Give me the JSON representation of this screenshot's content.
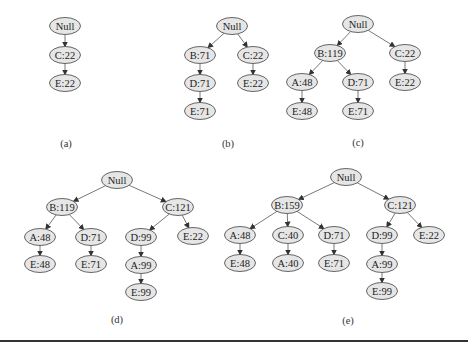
{
  "figure": {
    "node_fill": "#e6e6e6",
    "node_stroke": "#555555",
    "edge_color": "#555555",
    "trees": [
      {
        "id": "a",
        "caption": "(a)",
        "caption_pos": [
          66,
          143
        ],
        "nodes": [
          {
            "id": "null",
            "label": "Null",
            "x": 65,
            "y": 26
          },
          {
            "id": "c",
            "label": "C:22",
            "x": 65,
            "y": 55
          },
          {
            "id": "ce",
            "label": "E:22",
            "x": 65,
            "y": 83
          }
        ],
        "edges": [
          [
            "null",
            "c"
          ],
          [
            "c",
            "ce"
          ]
        ]
      },
      {
        "id": "b",
        "caption": "(b)",
        "caption_pos": [
          228,
          143
        ],
        "nodes": [
          {
            "id": "null",
            "label": "Null",
            "x": 232,
            "y": 26
          },
          {
            "id": "b",
            "label": "B:71",
            "x": 200,
            "y": 55
          },
          {
            "id": "c",
            "label": "C:22",
            "x": 253,
            "y": 55
          },
          {
            "id": "bd",
            "label": "D:71",
            "x": 200,
            "y": 83
          },
          {
            "id": "ce",
            "label": "E:22",
            "x": 253,
            "y": 83
          },
          {
            "id": "bde",
            "label": "E:71",
            "x": 200,
            "y": 111
          }
        ],
        "edges": [
          [
            "null",
            "b"
          ],
          [
            "null",
            "c"
          ],
          [
            "b",
            "bd"
          ],
          [
            "c",
            "ce"
          ],
          [
            "bd",
            "bde"
          ]
        ]
      },
      {
        "id": "c",
        "caption": "(c)",
        "caption_pos": [
          358,
          142
        ],
        "nodes": [
          {
            "id": "null",
            "label": "Null",
            "x": 358,
            "y": 24
          },
          {
            "id": "b",
            "label": "B:119",
            "x": 330,
            "y": 53
          },
          {
            "id": "c",
            "label": "C:22",
            "x": 405,
            "y": 53
          },
          {
            "id": "ba",
            "label": "A:48",
            "x": 302,
            "y": 82
          },
          {
            "id": "bd",
            "label": "D:71",
            "x": 358,
            "y": 82
          },
          {
            "id": "ce",
            "label": "E:22",
            "x": 405,
            "y": 82
          },
          {
            "id": "bae",
            "label": "E:48",
            "x": 302,
            "y": 111
          },
          {
            "id": "bde",
            "label": "E:71",
            "x": 358,
            "y": 111
          }
        ],
        "edges": [
          [
            "null",
            "b"
          ],
          [
            "null",
            "c"
          ],
          [
            "b",
            "ba"
          ],
          [
            "b",
            "bd"
          ],
          [
            "c",
            "ce"
          ],
          [
            "ba",
            "bae"
          ],
          [
            "bd",
            "bde"
          ]
        ]
      },
      {
        "id": "d",
        "caption": "(d)",
        "caption_pos": [
          117,
          319
        ],
        "nodes": [
          {
            "id": "null",
            "label": "Null",
            "x": 117,
            "y": 180
          },
          {
            "id": "b",
            "label": "B:119",
            "x": 62,
            "y": 207
          },
          {
            "id": "c",
            "label": "C:121",
            "x": 178,
            "y": 207
          },
          {
            "id": "ba",
            "label": "A:48",
            "x": 40,
            "y": 237
          },
          {
            "id": "bd",
            "label": "D:71",
            "x": 91,
            "y": 237
          },
          {
            "id": "cd",
            "label": "D:99",
            "x": 141,
            "y": 237
          },
          {
            "id": "ce",
            "label": "E:22",
            "x": 193,
            "y": 236
          },
          {
            "id": "bae",
            "label": "E:48",
            "x": 40,
            "y": 264
          },
          {
            "id": "bde",
            "label": "E:71",
            "x": 91,
            "y": 264
          },
          {
            "id": "cda",
            "label": "A:99",
            "x": 141,
            "y": 265
          },
          {
            "id": "cdae",
            "label": "E:99",
            "x": 141,
            "y": 292
          }
        ],
        "edges": [
          [
            "null",
            "b"
          ],
          [
            "null",
            "c"
          ],
          [
            "b",
            "ba"
          ],
          [
            "b",
            "bd"
          ],
          [
            "c",
            "cd"
          ],
          [
            "c",
            "ce"
          ],
          [
            "ba",
            "bae"
          ],
          [
            "bd",
            "bde"
          ],
          [
            "cd",
            "cda"
          ],
          [
            "cda",
            "cdae"
          ]
        ]
      },
      {
        "id": "e",
        "caption": "(e)",
        "caption_pos": [
          348,
          320
        ],
        "nodes": [
          {
            "id": "null",
            "label": "Null",
            "x": 346,
            "y": 177
          },
          {
            "id": "b",
            "label": "B:159",
            "x": 287,
            "y": 205
          },
          {
            "id": "c",
            "label": "C:121",
            "x": 400,
            "y": 205
          },
          {
            "id": "ba",
            "label": "A:48",
            "x": 240,
            "y": 235
          },
          {
            "id": "bc",
            "label": "C:40",
            "x": 288,
            "y": 235
          },
          {
            "id": "bd",
            "label": "D:71",
            "x": 334,
            "y": 235
          },
          {
            "id": "cd",
            "label": "D:99",
            "x": 382,
            "y": 235
          },
          {
            "id": "ce",
            "label": "E:22",
            "x": 429,
            "y": 235
          },
          {
            "id": "bae",
            "label": "E:48",
            "x": 240,
            "y": 263
          },
          {
            "id": "bca",
            "label": "A:40",
            "x": 288,
            "y": 263
          },
          {
            "id": "bde",
            "label": "E:71",
            "x": 334,
            "y": 263
          },
          {
            "id": "cda",
            "label": "A:99",
            "x": 382,
            "y": 264
          },
          {
            "id": "cdae",
            "label": "E:99",
            "x": 382,
            "y": 291
          }
        ],
        "edges": [
          [
            "null",
            "b"
          ],
          [
            "null",
            "c"
          ],
          [
            "b",
            "ba"
          ],
          [
            "b",
            "bc"
          ],
          [
            "b",
            "bd"
          ],
          [
            "c",
            "cd"
          ],
          [
            "c",
            "ce"
          ],
          [
            "ba",
            "bae"
          ],
          [
            "bc",
            "bca"
          ],
          [
            "bd",
            "bde"
          ],
          [
            "cd",
            "cda"
          ],
          [
            "cda",
            "cdae"
          ]
        ]
      }
    ]
  }
}
